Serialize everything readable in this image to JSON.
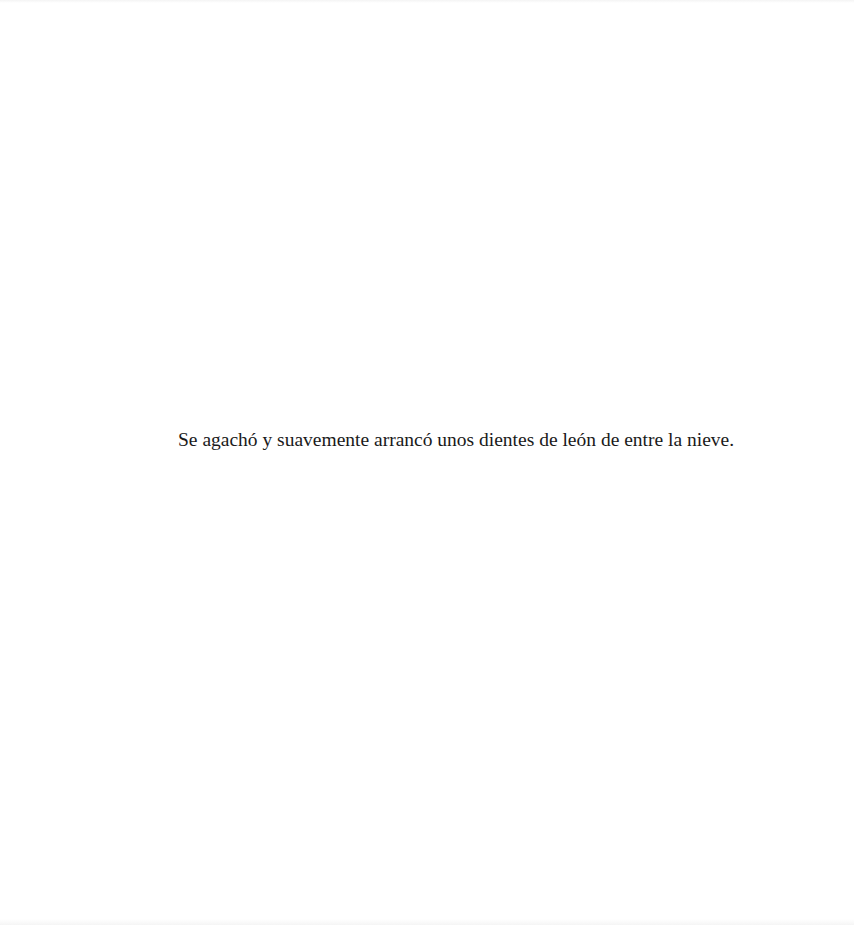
{
  "page": {
    "background": "#ffffff",
    "text_color": "#1a1a1a",
    "lines": [
      "Se agachó y suavemente arrancó unos dientes de león de entre la nieve."
    ]
  }
}
